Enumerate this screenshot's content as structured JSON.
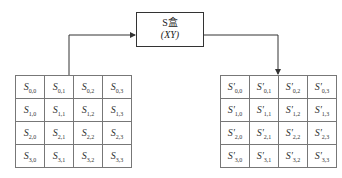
{
  "sbox": {
    "label": "S盒",
    "sub": "(XY)"
  },
  "left_state": {
    "symbol": "S",
    "cells": [
      [
        "S",
        "0,0"
      ],
      [
        "S",
        "0,1"
      ],
      [
        "S",
        "0,2"
      ],
      [
        "S",
        "0,3"
      ],
      [
        "S",
        "1,0"
      ],
      [
        "S",
        "1,1"
      ],
      [
        "S",
        "1,2"
      ],
      [
        "S",
        "1,3"
      ],
      [
        "S",
        "2,0"
      ],
      [
        "S",
        "2,1"
      ],
      [
        "S",
        "2,2"
      ],
      [
        "S",
        "2,3"
      ],
      [
        "S",
        "3,0"
      ],
      [
        "S",
        "3,1"
      ],
      [
        "S",
        "3,2"
      ],
      [
        "S",
        "3,3"
      ]
    ]
  },
  "right_state": {
    "symbol": "S′",
    "cells": [
      [
        "S′",
        "0,0"
      ],
      [
        "S′",
        "0,1"
      ],
      [
        "S′",
        "0,2"
      ],
      [
        "S′",
        "0,3"
      ],
      [
        "S′",
        "1,0"
      ],
      [
        "S′",
        "1,1"
      ],
      [
        "S′",
        "1,2"
      ],
      [
        "S′",
        "1,3"
      ],
      [
        "S′",
        "2,0"
      ],
      [
        "S′",
        "2,1"
      ],
      [
        "S′",
        "2,2"
      ],
      [
        "S′",
        "2,3"
      ],
      [
        "S′",
        "3,0"
      ],
      [
        "S′",
        "3,1"
      ],
      [
        "S′",
        "3,2"
      ],
      [
        "S′",
        "3,3"
      ]
    ]
  }
}
